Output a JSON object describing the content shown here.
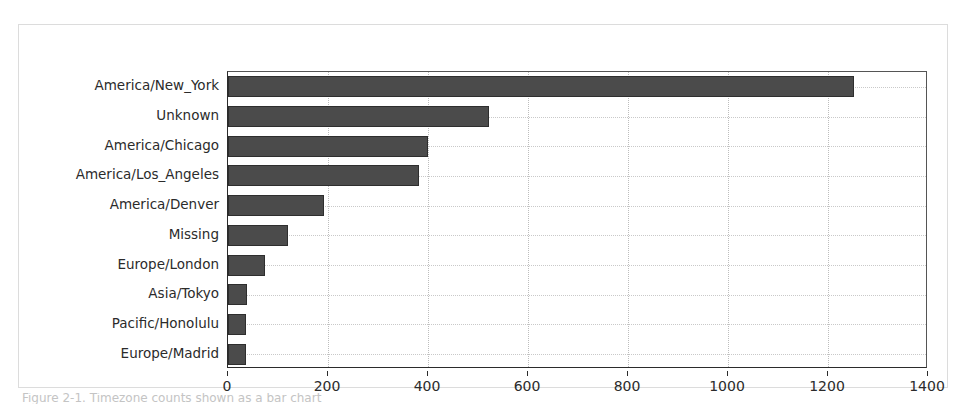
{
  "figure": {
    "caption_fragment": "Figure 2-1. Timezone counts shown as a bar chart"
  },
  "chart_data": {
    "type": "bar",
    "orientation": "horizontal",
    "title": "",
    "xlabel": "",
    "ylabel": "",
    "xlim": [
      0,
      1400
    ],
    "xticks": [
      0,
      200,
      400,
      600,
      800,
      1000,
      1200,
      1400
    ],
    "xticklabels": [
      "0",
      "200",
      "400",
      "600",
      "800",
      "1000",
      "1200",
      "1400"
    ],
    "grid": true,
    "legend": false,
    "bar_color": "#4b4b4b",
    "bar_edge_color": "#2e2e2e",
    "categories": [
      "Europe/Madrid",
      "Pacific/Honolulu",
      "Asia/Tokyo",
      "Europe/London",
      "Missing",
      "America/Denver",
      "America/Los_Angeles",
      "America/Chicago",
      "Unknown",
      "America/New_York"
    ],
    "values": [
      35,
      36,
      37,
      74,
      120,
      191,
      382,
      400,
      521,
      1251
    ]
  }
}
